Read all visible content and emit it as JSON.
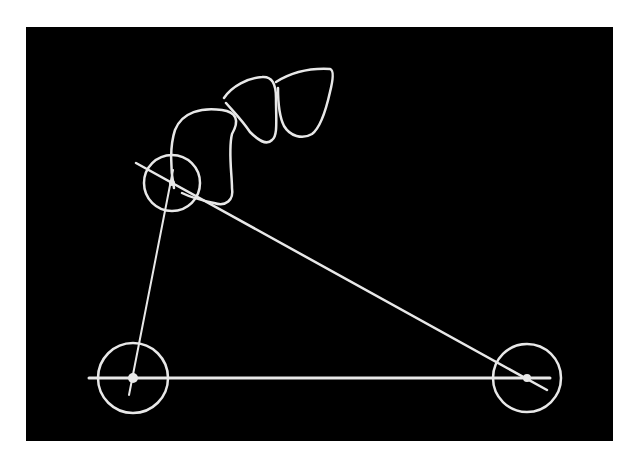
{
  "figure": {
    "background": "#ffffff",
    "panel_color": "#000000",
    "stroke_color": "#e8e8e8",
    "panel": {
      "x": 26,
      "y": 27,
      "width": 587,
      "height": 414
    }
  },
  "diagram": {
    "teeth": [
      {
        "name": "tooth-1",
        "path": "M174 188 C170 168 170 145 175 130 C182 112 202 107 222 110 C236 112 240 120 232 134 C228 150 232 175 232 188 C234 200 226 207 214 203 C200 200 188 196 182 193"
      },
      {
        "name": "tooth-2",
        "path": "M224 98 C232 86 248 78 262 77 C272 76 276 84 276 98 C276 120 278 136 272 140 C266 146 258 140 250 132 C242 120 232 110 226 103"
      },
      {
        "name": "tooth-3",
        "path": "M276 82 C292 72 312 68 330 69 C334 70 333 80 330 92 C326 110 320 128 312 134 C302 140 290 136 284 126 C278 114 278 98 278 88"
      }
    ],
    "circles": [
      {
        "name": "circle-upper-left",
        "cx": 172,
        "cy": 183,
        "r": 28
      },
      {
        "name": "circle-lower-left",
        "cx": 133,
        "cy": 378,
        "r": 35
      },
      {
        "name": "circle-lower-right",
        "cx": 527,
        "cy": 378,
        "r": 34
      }
    ],
    "points": [
      {
        "name": "point-upper-left",
        "cx": 172,
        "cy": 183,
        "r": 3
      },
      {
        "name": "point-lower-left",
        "cx": 133,
        "cy": 378,
        "r": 5
      },
      {
        "name": "point-lower-right",
        "cx": 527,
        "cy": 378,
        "r": 4
      }
    ],
    "lines": [
      {
        "name": "horizontal-base-line",
        "x1": 89,
        "y1": 378,
        "x2": 550,
        "y2": 378,
        "w": 3
      },
      {
        "name": "diagonal-line",
        "x1": 136,
        "y1": 163,
        "x2": 547,
        "y2": 390,
        "w": 2.5
      },
      {
        "name": "left-vertical-line",
        "x1": 173,
        "y1": 170,
        "x2": 129,
        "y2": 395,
        "w": 2
      }
    ]
  }
}
